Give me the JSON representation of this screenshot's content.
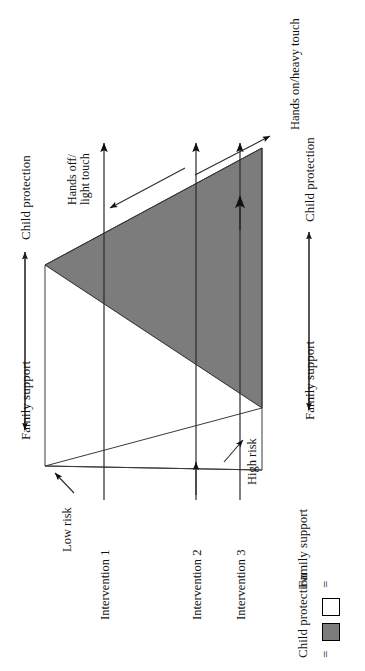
{
  "figure": {
    "type": "wedge-diagram",
    "orientation": "rotated-90-ccw",
    "shading_color": "#7c7c7c",
    "line_color": "#1a1a1a",
    "background": "#ffffff"
  },
  "axes": {
    "risk_axis": {
      "low_label": "Low risk",
      "high_label": "High risk"
    },
    "touch_axis": {
      "light_label": "Hands off/\nlight touch",
      "light_label_line1": "Hands off/",
      "light_label_line2": "light touch",
      "heavy_label": "Hands on/heavy touch"
    },
    "left_axis": {
      "top_label": "Child protection",
      "bottom_label": "Family support"
    },
    "right_axis": {
      "top_label": "Child protection",
      "bottom_label": "Family support"
    }
  },
  "interventions": [
    {
      "label": "Intervention 1"
    },
    {
      "label": "Intervention 2"
    },
    {
      "label": "Intervention 3"
    }
  ],
  "legend": {
    "items": [
      {
        "symbol": "=",
        "label": "Family support",
        "swatch": "#ffffff"
      },
      {
        "symbol": "=",
        "label": "Child protection",
        "swatch": "#7c7c7c"
      }
    ]
  }
}
